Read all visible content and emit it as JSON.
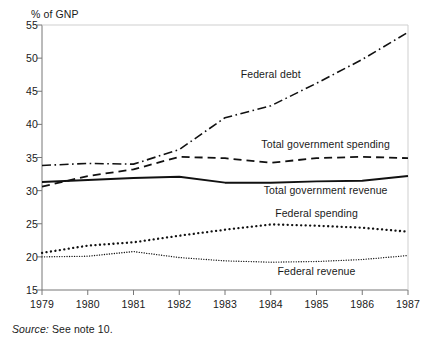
{
  "figure": {
    "ylabel": "% of GNP",
    "source_prefix": "Source:",
    "source_text": "See note 10."
  },
  "chart_data": {
    "type": "line",
    "title": "",
    "xlabel": "",
    "ylabel": "% of GNP",
    "xlim": [
      1979,
      1987
    ],
    "ylim": [
      15,
      55
    ],
    "grid": false,
    "legend_position": "inline-annotations",
    "x": [
      1979,
      1980,
      1981,
      1982,
      1983,
      1984,
      1985,
      1986,
      1987
    ],
    "xticklabels": [
      "1979",
      "1980",
      "1981",
      "1982",
      "1983",
      "1984",
      "1985",
      "1986",
      "1987"
    ],
    "yticks": [
      15,
      20,
      25,
      30,
      35,
      40,
      45,
      50,
      55
    ],
    "yticklabels": [
      "15",
      "20",
      "25",
      "30",
      "35",
      "40",
      "45",
      "50",
      "55"
    ],
    "series": [
      {
        "name": "Federal debt",
        "style": "dash-dot",
        "color": "#111111",
        "values": [
          33.8,
          34.1,
          34.0,
          36.2,
          41.0,
          42.8,
          46.2,
          49.8,
          53.9
        ]
      },
      {
        "name": "Total government spending",
        "style": "dashed",
        "color": "#111111",
        "values": [
          30.6,
          32.2,
          33.2,
          35.1,
          34.9,
          34.2,
          34.9,
          35.1,
          34.9
        ]
      },
      {
        "name": "Total government revenue",
        "style": "solid",
        "color": "#111111",
        "values": [
          31.3,
          31.6,
          31.9,
          32.1,
          31.2,
          31.2,
          31.4,
          31.5,
          32.2
        ]
      },
      {
        "name": "Federal spending",
        "style": "dotted-coarse",
        "color": "#111111",
        "values": [
          20.6,
          21.7,
          22.2,
          23.2,
          24.1,
          24.9,
          24.7,
          24.4,
          23.8
        ]
      },
      {
        "name": "Federal revenue",
        "style": "dotted-fine",
        "color": "#111111",
        "values": [
          20.0,
          20.1,
          20.8,
          19.9,
          19.4,
          19.2,
          19.3,
          19.6,
          20.2
        ]
      }
    ],
    "annotations": [
      {
        "text": "Federal debt",
        "x": 1984.0,
        "y": 47.6
      },
      {
        "text": "Total government spending",
        "x": 1985.2,
        "y": 37.1
      },
      {
        "text": "Total government revenue",
        "x": 1985.2,
        "y": 30.1
      },
      {
        "text": "Federal spending",
        "x": 1985.0,
        "y": 26.6
      },
      {
        "text": "Federal revenue",
        "x": 1985.0,
        "y": 17.9
      }
    ]
  }
}
